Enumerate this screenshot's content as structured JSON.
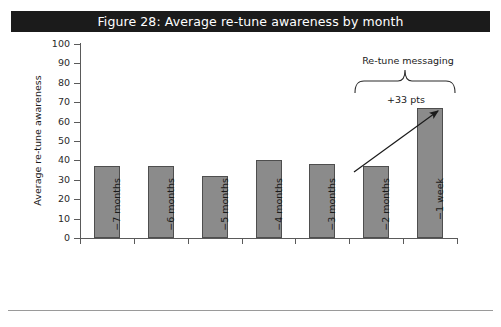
{
  "figure": {
    "title": "Figure 28: Average re-tune awareness by month",
    "title_bar_color": "#1b1b1b",
    "title_text_color": "#ffffff"
  },
  "annotations": {
    "bracket_label": "Re-tune messaging",
    "delta_label": "+33 pts",
    "arrow": "arrow-up-right"
  },
  "chart_data": {
    "type": "bar",
    "title": "Figure 28: Average re-tune awareness by month",
    "xlabel": "",
    "ylabel": "Average re-tune awareness",
    "ylim": [
      0,
      100
    ],
    "ytick_step": 10,
    "yticks": [
      "100",
      "90",
      "80",
      "70",
      "60",
      "50",
      "40",
      "30",
      "20",
      "10",
      "0"
    ],
    "grid": false,
    "legend": false,
    "bar_color": "#8b8b8b",
    "bar_border_color": "#4e4e4e",
    "categories": [
      "−7 months",
      "−6 months",
      "−5 months",
      "−4 months",
      "−3 months",
      "−2 months",
      "−1 week"
    ],
    "values": [
      37,
      37,
      32,
      40,
      38,
      37,
      67
    ],
    "annotations": [
      {
        "text": "Re-tune messaging",
        "covers": [
          "−2 months",
          "−1 week"
        ]
      },
      {
        "text": "+33 pts",
        "from_category": "−2 months",
        "to_category": "−1 week"
      }
    ]
  }
}
